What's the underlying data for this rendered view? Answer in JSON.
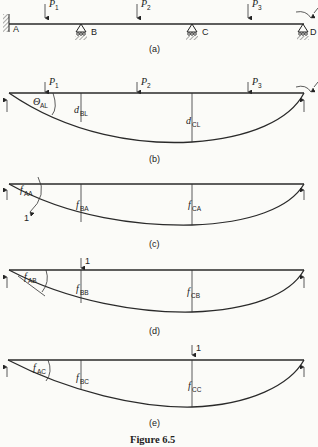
{
  "figure": {
    "title": "Figure 6.5",
    "panels": [
      {
        "id": "a",
        "caption": "(a)",
        "supports": [
          "A",
          "B",
          "C",
          "D"
        ],
        "loads": [
          "P1",
          "P2",
          "P3"
        ]
      },
      {
        "id": "b",
        "caption": "(b)",
        "labels": [
          "θAL",
          "dBL",
          "dCL"
        ],
        "loads": [
          "P1",
          "P2",
          "P3"
        ]
      },
      {
        "id": "c",
        "caption": "(c)",
        "labels": [
          "fAA",
          "fBA",
          "fCA"
        ],
        "unit_moment": "1"
      },
      {
        "id": "d",
        "caption": "(d)",
        "labels": [
          "fAB",
          "fBB",
          "fCB"
        ],
        "unit_load": "1"
      },
      {
        "id": "e",
        "caption": "(e)",
        "labels": [
          "fAC",
          "fBC",
          "fCC"
        ],
        "unit_load": "1"
      }
    ]
  },
  "text": {
    "A": "A",
    "B": "B",
    "C": "C",
    "D": "D",
    "P": "P",
    "s1": "1",
    "s2": "2",
    "s3": "3",
    "cap_a": "(a)",
    "cap_b": "(b)",
    "cap_c": "(c)",
    "cap_d": "(d)",
    "cap_e": "(e)",
    "theta": "Θ",
    "AL": "AL",
    "d": "d",
    "BL": "BL",
    "CL": "CL",
    "f": "f",
    "AA": "AA",
    "BA": "BA",
    "CA": "CA",
    "AB": "AB",
    "BB": "BB",
    "CB": "CB",
    "AC": "AC",
    "BC": "BC",
    "CC": "CC",
    "one": "1",
    "fig_title": "Figure 6.5"
  }
}
